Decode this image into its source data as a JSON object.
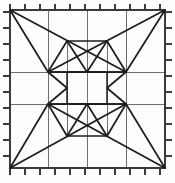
{
  "figure": {
    "symmetry": "4-fold dihedral",
    "background_color": "#fdfdfc"
  },
  "colors": {
    "border": "#3a3a3a",
    "grid": "#6f6f6f",
    "motif": "#1c1c1c",
    "tick": "#3a3a3a",
    "paper": "#fdfdfc"
  },
  "chart_data": {
    "type": "diagram",
    "xlabel": "",
    "ylabel": "",
    "grid": true,
    "legend": "none",
    "xlim": [
      10,
      165
    ],
    "ylim": [
      10,
      168
    ],
    "frame": {
      "left": 10,
      "top": 10,
      "right": 165,
      "bottom": 168
    },
    "grid_lines": {
      "vertical_x": [
        48,
        87,
        126
      ],
      "horizontal_y": [
        72,
        104
      ]
    },
    "key_points": {
      "corner_tl": [
        10,
        10
      ],
      "corner_tr": [
        165,
        10
      ],
      "corner_bl": [
        10,
        168
      ],
      "corner_br": [
        165,
        168
      ],
      "node_left_upper": [
        48,
        72
      ],
      "node_left_lower": [
        48,
        104
      ],
      "node_right_upper": [
        126,
        72
      ],
      "node_right_lower": [
        126,
        104
      ],
      "node_top_left": [
        67,
        41
      ],
      "node_top_right": [
        107,
        41
      ],
      "node_bottom_left": [
        67,
        136
      ],
      "node_bottom_right": [
        107,
        136
      ],
      "center_tl": [
        67,
        72
      ],
      "center_tr": [
        107,
        72
      ],
      "center_bl": [
        67,
        104
      ],
      "center_br": [
        107,
        104
      ],
      "chevron_tip_top": [
        87,
        72
      ],
      "chevron_tip_bottom": [
        87,
        104
      ],
      "chevron_tip_left": [
        67,
        88
      ],
      "chevron_tip_right": [
        107,
        88
      ]
    },
    "central_square": {
      "left": 67,
      "top": 72,
      "right": 107,
      "bottom": 104,
      "filled": false
    },
    "ticks": {
      "per_edge": 11,
      "length": 5,
      "top_x": [
        30,
        45,
        60,
        75,
        90,
        105,
        120,
        135,
        150,
        165
      ],
      "bottom_x": [
        25,
        40,
        55,
        70,
        85,
        100,
        115,
        130,
        145,
        160
      ],
      "left_y": [
        28,
        44,
        60,
        76,
        92,
        108,
        124,
        140,
        156
      ],
      "right_y": [
        28,
        44,
        60,
        76,
        92,
        108,
        124,
        140,
        156
      ]
    },
    "shapes": [
      {
        "name": "corner-triangle-top-left",
        "vertices": [
          [
            10,
            10
          ],
          [
            126,
            72
          ],
          [
            48,
            72
          ]
        ]
      },
      {
        "name": "corner-triangle-top-right",
        "vertices": [
          [
            165,
            10
          ],
          [
            48,
            72
          ],
          [
            126,
            72
          ]
        ]
      },
      {
        "name": "corner-triangle-bottom-left",
        "vertices": [
          [
            10,
            168
          ],
          [
            126,
            104
          ],
          [
            48,
            104
          ]
        ]
      },
      {
        "name": "corner-triangle-bottom-right",
        "vertices": [
          [
            165,
            168
          ],
          [
            48,
            104
          ],
          [
            126,
            104
          ]
        ]
      },
      {
        "name": "chevron-top",
        "vertices": [
          [
            67,
            41
          ],
          [
            87,
            72
          ],
          [
            107,
            41
          ]
        ]
      },
      {
        "name": "chevron-bottom",
        "vertices": [
          [
            67,
            136
          ],
          [
            87,
            104
          ],
          [
            107,
            136
          ]
        ]
      },
      {
        "name": "chevron-left",
        "vertices": [
          [
            48,
            72
          ],
          [
            67,
            88
          ],
          [
            48,
            104
          ]
        ]
      },
      {
        "name": "chevron-right",
        "vertices": [
          [
            126,
            72
          ],
          [
            107,
            88
          ],
          [
            126,
            104
          ]
        ]
      }
    ]
  }
}
